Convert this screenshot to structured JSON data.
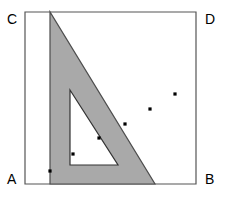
{
  "figure": {
    "canvas": {
      "width": 229,
      "height": 205,
      "background": "#ffffff"
    },
    "labels": {
      "A": "A",
      "B": "B",
      "C": "C",
      "D": "D"
    },
    "colors": {
      "square_stroke": "#555555",
      "triangle_fill": "#a9a9a9",
      "triangle_stroke": "#4d4d4d",
      "hole_fill": "#ffffff",
      "hole_stroke": "#333333",
      "point_fill": "#000000",
      "background": "#ffffff"
    },
    "square": {
      "name": "square-ABCD",
      "vertices": {
        "C": [
          25,
          12
        ],
        "D": [
          196,
          12
        ],
        "B": [
          196,
          184
        ],
        "A": [
          25,
          184
        ]
      },
      "stroke_width": 1.2
    },
    "set_square": {
      "name": "shaded-right-triangle",
      "points": "50,12 50,184 155,184",
      "stroke_width": 1.2
    },
    "inner_hole": {
      "name": "inner-white-triangle",
      "points": "70,90 70,165 118,165",
      "stroke_width": 1.2
    },
    "marked_points": [
      {
        "id": "p1",
        "x": 50,
        "y": 171,
        "size": 3.2
      },
      {
        "id": "p2",
        "x": 73,
        "y": 154,
        "size": 3.2
      },
      {
        "id": "p3",
        "x": 99,
        "y": 138,
        "size": 3.2
      },
      {
        "id": "p4",
        "x": 125,
        "y": 124,
        "size": 3.2
      },
      {
        "id": "p5",
        "x": 150,
        "y": 109,
        "size": 3.2
      },
      {
        "id": "p6",
        "x": 175,
        "y": 94,
        "size": 3.2
      }
    ]
  }
}
